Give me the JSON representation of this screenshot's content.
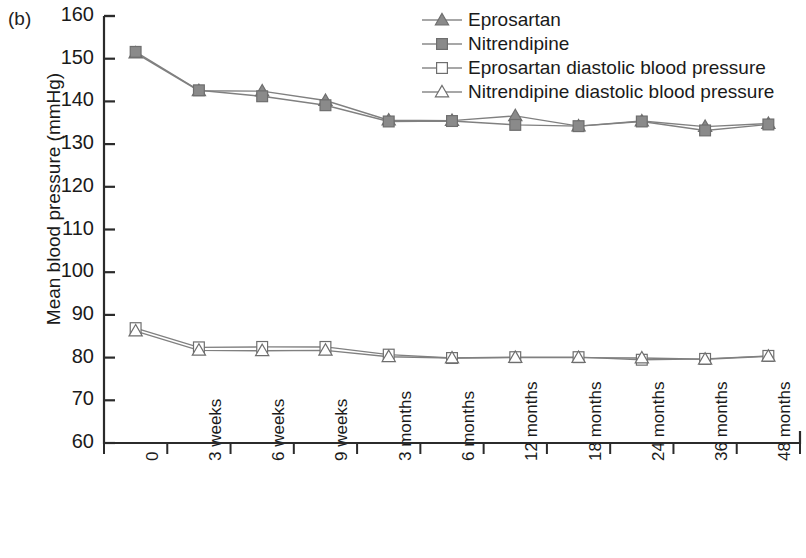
{
  "panel": {
    "label": "(b)"
  },
  "chart_data": {
    "type": "line",
    "title": "",
    "subtitle": "",
    "xlabel": "",
    "ylabel": "Mean blood pressure (mmHg)",
    "ylim": [
      60,
      160
    ],
    "ytick_step": 10,
    "yticks": [
      160,
      150,
      140,
      130,
      120,
      110,
      100,
      90,
      80,
      70,
      60
    ],
    "grid": false,
    "legend_position": "top-right",
    "categories": [
      "0",
      "3 weeks",
      "6 weeks",
      "9 weeks",
      "3 months",
      "6 months",
      "12 months",
      "18 months",
      "24 months",
      "36 months",
      "48 months"
    ],
    "series": [
      {
        "name": "Eprosartan",
        "marker": "filled-triangle",
        "color": "#808080",
        "values": [
          151.3,
          142.5,
          142.4,
          140.2,
          135.6,
          135.5,
          136.6,
          134.2,
          135.4,
          134.1,
          134.8
        ]
      },
      {
        "name": "Nitrendipine",
        "marker": "filled-square",
        "color": "#808080",
        "values": [
          151.6,
          142.6,
          141.2,
          139.1,
          135.3,
          135.4,
          134.5,
          134.2,
          135.3,
          133.2,
          134.6
        ]
      },
      {
        "name": "Eprosartan diastolic blood pressure",
        "marker": "open-square",
        "color": "#808080",
        "values": [
          86.9,
          82.4,
          82.5,
          82.5,
          80.7,
          79.9,
          80.1,
          80.1,
          79.5,
          79.7,
          80.4
        ]
      },
      {
        "name": "Nitrendipine diastolic blood pressure",
        "marker": "open-triangle",
        "color": "#808080",
        "values": [
          86.2,
          81.7,
          81.6,
          81.7,
          80.2,
          79.9,
          80.0,
          80.0,
          79.9,
          79.6,
          80.3
        ]
      }
    ]
  },
  "colors": {
    "axis": "#2b2b2b",
    "marker_fill": "#8a8a8a",
    "marker_edge": "#6e6e6e",
    "line": "#8a8a8a",
    "open_fill": "#ffffff",
    "text": "#1a1a1a"
  }
}
